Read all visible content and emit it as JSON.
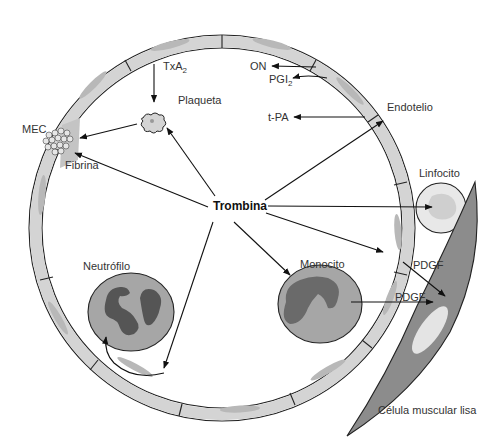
{
  "diagram": {
    "center_label": "Trombina",
    "labels": {
      "txa2": "TxA",
      "txa2_sub": "2",
      "plaqueta": "Plaqueta",
      "mec": "MEC",
      "fibrina": "Fibrina",
      "on": "ON",
      "pgi2": "PGI",
      "pgi2_sub": "2",
      "tpa": "t-PA",
      "endotelio": "Endotelio",
      "linfocito": "Linfocito",
      "neutrofilo": "Neutrófilo",
      "monocito": "Monocito",
      "pdgf_1": "PDGF",
      "pdgf_2": "PDGF",
      "celula_muscular": "Célula muscular lisa"
    },
    "colors": {
      "cell_fill": "#d4d4d4",
      "leukocyte_fill": "#a6a6a6",
      "nucleus_dark": "#555555",
      "smooth_muscle": "#8c8c8c",
      "stroke": "#222222"
    }
  }
}
